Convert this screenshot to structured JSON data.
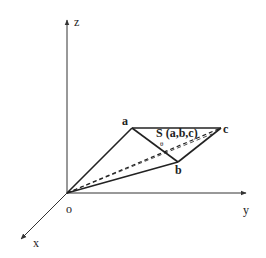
{
  "diagram": {
    "axes": {
      "z": "z",
      "y": "y",
      "x": "x",
      "origin": "o"
    },
    "points": {
      "a": "a",
      "b": "b",
      "c": "c"
    },
    "region_label": "S (a,b,c)",
    "point_label": "θ",
    "colors": {
      "stroke": "#222222",
      "background": "#ffffff"
    }
  }
}
